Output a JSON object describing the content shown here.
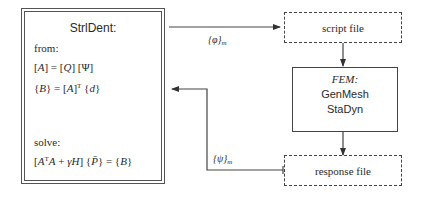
{
  "strldent": {
    "title": "StrlDent:",
    "from_label": "from:",
    "eq1": {
      "lhs": "A",
      "q": "Q",
      "psi": "Ψ"
    },
    "eq2": {
      "lhs": "B",
      "a": "A",
      "sup": "T",
      "d": "d"
    },
    "solve_label": "solve:",
    "eq3": {
      "a1": "A",
      "sup": "T",
      "a2": "A",
      "gamma": "γ",
      "h": "H",
      "p": "P̄",
      "b": "B"
    }
  },
  "script_file": {
    "label": "script file"
  },
  "fem": {
    "label": "FEM:",
    "items": [
      "GenMesh",
      "StaDyn"
    ]
  },
  "response_file": {
    "label": "response file"
  },
  "arrows": {
    "phi_label": "{φ}",
    "phi_sub": "m",
    "psi_label": "{ψ}",
    "psi_sub": "m"
  },
  "colors": {
    "stroke": "#444444",
    "text": "#2a2a2a",
    "background": "#ffffff"
  }
}
